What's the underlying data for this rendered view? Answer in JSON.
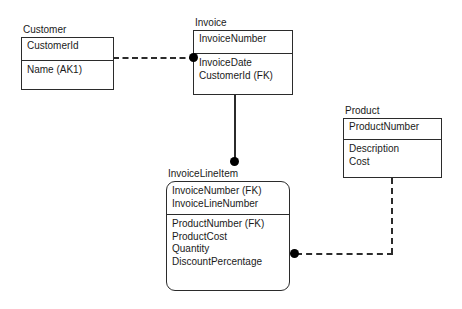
{
  "diagram": {
    "type": "entity-relationship-diagram",
    "notation": "IDEF1X",
    "background_color": "#ffffff",
    "line_color": "#2b2b2b",
    "text_color": "#1a1a1a",
    "entities": [
      {
        "id": "customer",
        "name": "Customer",
        "kind": "independent",
        "primary_key": [
          "CustomerId"
        ],
        "attributes": [
          "Name (AK1)"
        ]
      },
      {
        "id": "invoice",
        "name": "Invoice",
        "kind": "independent",
        "primary_key": [
          "InvoiceNumber"
        ],
        "attributes": [
          "InvoiceDate",
          "CustomerId (FK)"
        ]
      },
      {
        "id": "product",
        "name": "Product",
        "kind": "independent",
        "primary_key": [
          "ProductNumber"
        ],
        "attributes": [
          "Description",
          "Cost"
        ]
      },
      {
        "id": "invoicelineitem",
        "name": "InvoiceLineItem",
        "kind": "dependent",
        "primary_key": [
          "InvoiceNumber (FK)",
          "InvoiceLineNumber"
        ],
        "attributes": [
          "ProductNumber (FK)",
          "ProductCost",
          "Quantity",
          "DiscountPercentage"
        ]
      }
    ],
    "relationships": [
      {
        "id": "customer-invoice",
        "from": "Customer",
        "to": "Invoice",
        "line_style": "dashed",
        "type": "non-identifying",
        "child_marker": "filled-circle"
      },
      {
        "id": "invoice-invoicelineitem",
        "from": "Invoice",
        "to": "InvoiceLineItem",
        "line_style": "solid",
        "type": "identifying",
        "child_marker": "filled-circle"
      },
      {
        "id": "product-invoicelineitem",
        "from": "Product",
        "to": "InvoiceLineItem",
        "line_style": "dashed",
        "type": "non-identifying",
        "child_marker": "filled-circle"
      }
    ]
  }
}
